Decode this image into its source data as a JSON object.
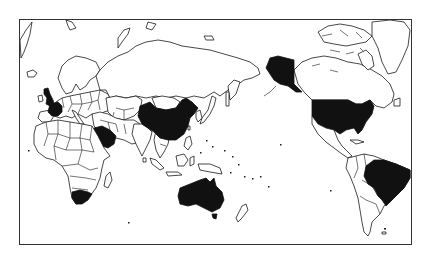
{
  "map": {
    "projection": "pacific-centered world",
    "frame": {
      "x": 19,
      "y": 19,
      "width": 393,
      "height": 226
    },
    "colors": {
      "highlight": "#111111",
      "land": "#ffffff",
      "outline": "#1a1a1a",
      "background": "#ffffff"
    },
    "highlighted_countries": [
      "United Kingdom",
      "France",
      "Saudi Arabia",
      "South Africa",
      "China",
      "Australia",
      "United States",
      "Brazil"
    ]
  }
}
